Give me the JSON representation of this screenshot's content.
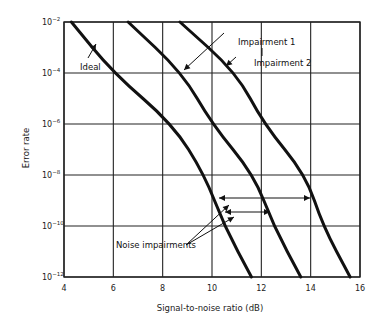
{
  "chart_data": {
    "type": "line",
    "title": "",
    "xlabel": "Signal-to-noise ratio (dB)",
    "ylabel": "Error rate",
    "xlim": [
      4,
      16
    ],
    "ylim_log10": [
      -12,
      -2
    ],
    "y_scale": "log",
    "grid": true,
    "x_ticks": [
      "4",
      "6",
      "8",
      "10",
      "12",
      "14",
      "16"
    ],
    "y_ticks": [
      {
        "base": "10",
        "exp": "−2"
      },
      {
        "base": "10",
        "exp": "−4"
      },
      {
        "base": "10",
        "exp": "−6"
      },
      {
        "base": "10",
        "exp": "−8"
      },
      {
        "base": "10",
        "exp": "−10"
      },
      {
        "base": "10",
        "exp": "−12"
      }
    ],
    "series": [
      {
        "name": "Ideal",
        "points": [
          [
            4.3,
            -2
          ],
          [
            6.0,
            -4
          ],
          [
            8.4,
            -6
          ],
          [
            9.7,
            -8
          ],
          [
            10.5,
            -10
          ],
          [
            11.6,
            -12
          ]
        ]
      },
      {
        "name": "Impairment 1",
        "points": [
          [
            6.6,
            -2
          ],
          [
            8.8,
            -4
          ],
          [
            10.0,
            -6
          ],
          [
            11.7,
            -8
          ],
          [
            12.5,
            -10
          ],
          [
            13.6,
            -12
          ]
        ]
      },
      {
        "name": "Impairment 2",
        "points": [
          [
            8.7,
            -2
          ],
          [
            11.0,
            -4
          ],
          [
            12.1,
            -6
          ],
          [
            13.8,
            -8
          ],
          [
            14.5,
            -10
          ],
          [
            15.6,
            -12
          ]
        ]
      }
    ],
    "annotations": [
      {
        "text": "Ideal",
        "arrow_to_series": "Ideal"
      },
      {
        "text": "Impairment 1",
        "arrow_to_series": "Impairment 1"
      },
      {
        "text": "Impairment 2",
        "arrow_to_series": "Impairment 2"
      },
      {
        "text": "Noise impairments",
        "arrows": "two double-headed horizontal arrows between Ideal curve and impairment curves near error rate 10^-9"
      }
    ]
  },
  "labels": {
    "xlabel": "Signal-to-noise ratio (dB)",
    "ylabel": "Error rate",
    "ideal": "Ideal",
    "imp1": "Impairment 1",
    "imp2": "Impairment 2",
    "noise": "Noise impairments"
  }
}
